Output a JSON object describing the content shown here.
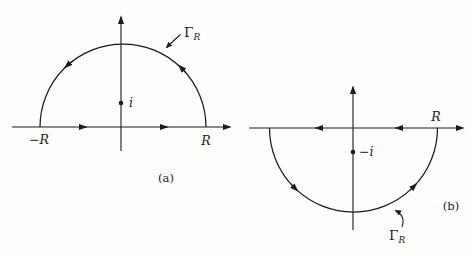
{
  "colors": {
    "ink": "#1c1c1c",
    "background": "#fdfdfb"
  },
  "figure": {
    "left": {
      "contour_label": {
        "gamma": "Γ",
        "sub": "R"
      },
      "pole_label": "i",
      "left_end_label": "−R",
      "right_end_label": "R",
      "caption": "(a)"
    },
    "right": {
      "contour_label": {
        "gamma": "Γ",
        "sub": "R"
      },
      "pole_label": "−i",
      "right_end_label": "R",
      "caption": "(b)"
    }
  }
}
